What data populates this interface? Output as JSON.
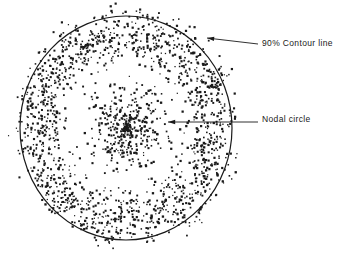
{
  "figure": {
    "title": "",
    "background_color": "#ffffff",
    "ink_color": "#1a1a1a",
    "width": 347,
    "height": 258
  },
  "annotations": [
    {
      "id": "contour-line",
      "label": "90% Contour line",
      "text_x": 262,
      "text_y": 39,
      "leader_from_x": 258,
      "leader_from_y": 44,
      "leader_to_x": 207,
      "leader_to_y": 38,
      "arrowhead": true
    },
    {
      "id": "nodal-circle",
      "label": "Nodal circle",
      "text_x": 262,
      "text_y": 115,
      "leader_from_x": 258,
      "leader_from_y": 122,
      "leader_to_x": 168,
      "leader_to_y": 122,
      "arrowhead": true
    }
  ],
  "chart_data": {
    "type": "scatter",
    "title": "",
    "subtitle": "",
    "xlabel": "",
    "ylabel": "",
    "grid": false,
    "legend_position": "right-external",
    "axis_visible": false,
    "pattern": {
      "center_x": 126,
      "center_y": 128,
      "contour_circle": {
        "label": "90% Contour line",
        "radius_x": 106,
        "radius_y": 112,
        "stroke_width": 1.2,
        "stroke_color": "#1a1a1a",
        "fill": "none"
      },
      "nodal_circle": {
        "label": "Nodal circle",
        "radius_x": 50,
        "radius_y": 53,
        "drawn": false
      },
      "total_points": 2000,
      "radial_density_profile": {
        "r_normalized": [
          0.0,
          0.08,
          0.16,
          0.24,
          0.32,
          0.4,
          0.48,
          0.56,
          0.64,
          0.72,
          0.8,
          0.88,
          0.96,
          1.04,
          1.12
        ],
        "relative_density": [
          1.0,
          0.92,
          0.74,
          0.52,
          0.33,
          0.17,
          0.06,
          0.03,
          0.12,
          0.33,
          0.48,
          0.52,
          0.44,
          0.22,
          0.05
        ]
      },
      "point_style": {
        "shape": "square",
        "size_px": 1.6,
        "color": "#1a1a1a"
      }
    }
  }
}
